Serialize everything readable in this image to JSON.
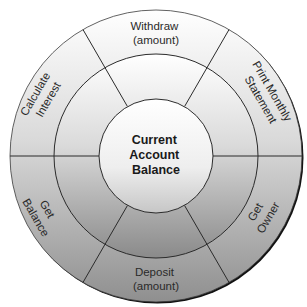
{
  "diagram": {
    "type": "concentric-ring-diagram",
    "colors": {
      "gradient_top": "#ffffff",
      "gradient_bottom": "#8e8e8e",
      "line": "#2b2b2b",
      "shadow": "#0a0a0a"
    },
    "center": {
      "label_lines": [
        "Current",
        "Account",
        "Balance"
      ]
    },
    "sectors": [
      {
        "id": "withdraw",
        "lines": [
          "Withdraw",
          "(amount)"
        ],
        "position": "top"
      },
      {
        "id": "print-monthly-statement",
        "lines": [
          "Print Monthly",
          "Statement"
        ],
        "position": "upper-right"
      },
      {
        "id": "get-owner",
        "lines": [
          "Get",
          "Owner"
        ],
        "position": "lower-right"
      },
      {
        "id": "deposit",
        "lines": [
          "Deposit",
          "(amount)"
        ],
        "position": "bottom"
      },
      {
        "id": "get-balance",
        "lines": [
          "Get",
          "Balance"
        ],
        "position": "lower-left"
      },
      {
        "id": "calculate-interest",
        "lines": [
          "Calculate",
          "Interest"
        ],
        "position": "upper-left"
      }
    ]
  }
}
